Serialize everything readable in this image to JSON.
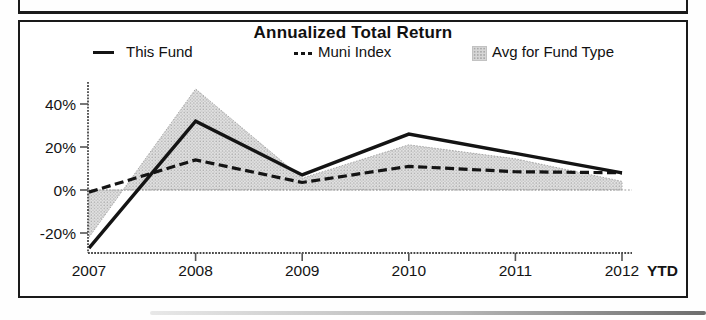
{
  "page": {
    "background": "#ffffff",
    "ink_color": "#141414"
  },
  "chart_data": {
    "type": "line",
    "title": "Annualized Total Return",
    "categories": [
      "2007",
      "2008",
      "2009",
      "2010",
      "2011",
      "2012"
    ],
    "x_suffix_label": "YTD",
    "ytick_values": [
      -20,
      0,
      20,
      40
    ],
    "ytick_labels": [
      "-20%",
      "0%",
      "20%",
      "40%"
    ],
    "ylim": [
      -30,
      50
    ],
    "baseline": 0,
    "grid": "zero-line-only",
    "legend_position": "top",
    "series": [
      {
        "name": "This Fund",
        "style": "solid-line",
        "color": "#141414",
        "values": [
          -27,
          32,
          7,
          26,
          17,
          8
        ]
      },
      {
        "name": "Muni Index",
        "style": "dashed-line",
        "color": "#141414",
        "values": [
          -1,
          14,
          3.5,
          11,
          8.5,
          8
        ]
      },
      {
        "name": "Avg for Fund Type",
        "style": "shaded-area",
        "color": "#d4d4d4",
        "values": [
          -22,
          47,
          5.5,
          21,
          14.5,
          4
        ]
      }
    ]
  }
}
